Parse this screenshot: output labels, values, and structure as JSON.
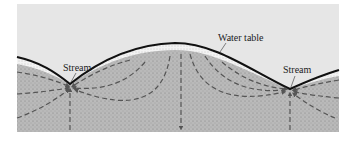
{
  "diagram": {
    "type": "cross-section",
    "labels": {
      "water_table": "Water table",
      "stream_left": "Stream",
      "stream_right": "Stream"
    },
    "colors": {
      "sky": "#e6e6e6",
      "unsaturated_zone": "#f2f2f2",
      "saturated_zone": "#b8b8b8",
      "surface_line": "#111111",
      "flow_arrows": "#555555"
    }
  }
}
